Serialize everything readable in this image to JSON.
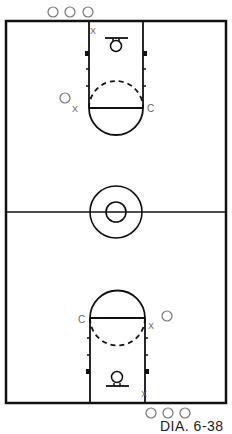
{
  "diagram": {
    "type": "basketball-court",
    "caption": "DIA. 6-38",
    "labels": {
      "x_mark": "X",
      "c_mark": "C"
    },
    "colors": {
      "line": "#111111",
      "marker": "#777777",
      "background": "#ffffff"
    },
    "top_half": {
      "offensive_players_outside": 3,
      "defender_on_lane": "X",
      "wing_player": "O",
      "wing_defender": "X",
      "center_label": "C"
    },
    "bottom_half": {
      "offensive_players_outside": 3,
      "defender_on_lane": "X",
      "wing_player": "O",
      "wing_defender": "X",
      "center_label": "C"
    }
  }
}
